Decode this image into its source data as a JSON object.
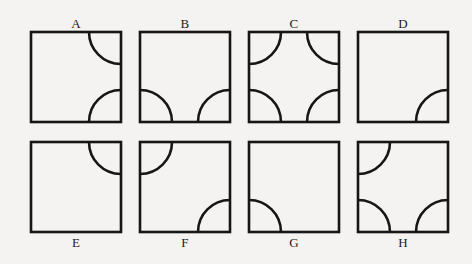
{
  "figure": {
    "background_color": "#f5f3f1",
    "stroke_color": "#161616",
    "width": 472,
    "height": 264,
    "square_size": 90,
    "arc_radius": 32,
    "stroke_width": 2.6
  },
  "panels": [
    {
      "label": "A",
      "label_position": "top",
      "x": 31,
      "y": 17,
      "arcs": [
        "top-right",
        "bottom-right"
      ],
      "arc_count": 2
    },
    {
      "label": "B",
      "label_position": "top",
      "x": 140,
      "y": 17,
      "arcs": [
        "bottom-left",
        "bottom-right"
      ],
      "arc_count": 2
    },
    {
      "label": "C",
      "label_position": "top",
      "x": 249,
      "y": 17,
      "arcs": [
        "top-left",
        "top-right",
        "bottom-left",
        "bottom-right"
      ],
      "arc_count": 4
    },
    {
      "label": "D",
      "label_position": "top",
      "x": 358,
      "y": 17,
      "arcs": [
        "bottom-right"
      ],
      "arc_count": 1
    },
    {
      "label": "E",
      "label_position": "bottom",
      "x": 31,
      "y": 141,
      "arcs": [
        "top-right"
      ],
      "arc_count": 1
    },
    {
      "label": "F",
      "label_position": "bottom",
      "x": 140,
      "y": 141,
      "arcs": [
        "top-left",
        "bottom-right"
      ],
      "arc_count": 2
    },
    {
      "label": "G",
      "label_position": "bottom",
      "x": 249,
      "y": 141,
      "arcs": [
        "bottom-left"
      ],
      "arc_count": 1
    },
    {
      "label": "H",
      "label_position": "bottom",
      "x": 358,
      "y": 141,
      "arcs": [
        "top-left",
        "bottom-left",
        "bottom-right"
      ],
      "arc_count": 3
    }
  ]
}
